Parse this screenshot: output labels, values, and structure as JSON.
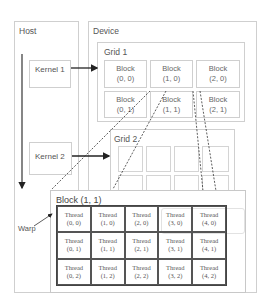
{
  "host": {
    "label": "Host"
  },
  "device": {
    "label": "Device"
  },
  "kernels": [
    {
      "label": "Kernel 1"
    },
    {
      "label": "Kernel 2"
    }
  ],
  "grid1": {
    "label": "Grid 1",
    "blocks": [
      {
        "title": "Block",
        "index": "(0, 0)"
      },
      {
        "title": "Block",
        "index": "(1, 0)"
      },
      {
        "title": "Block",
        "index": "(2, 0)"
      },
      {
        "title": "Block",
        "index": "(0, 1)"
      },
      {
        "title": "Block",
        "index": "(1, 1)"
      },
      {
        "title": "Block",
        "index": "(2, 1)"
      }
    ]
  },
  "grid2": {
    "label": "Grid 2"
  },
  "block_detail": {
    "label": "Block (1, 1)",
    "threads": [
      {
        "title": "Thread",
        "index": "(0, 0)"
      },
      {
        "title": "Thread",
        "index": "(1, 0)"
      },
      {
        "title": "Thread",
        "index": "(2, 0)"
      },
      {
        "title": "Thread",
        "index": "(3, 0)"
      },
      {
        "title": "Thread",
        "index": "(4, 0)"
      },
      {
        "title": "Thread",
        "index": "(0, 1)"
      },
      {
        "title": "Thread",
        "index": "(1, 1)"
      },
      {
        "title": "Thread",
        "index": "(2, 1)"
      },
      {
        "title": "Thread",
        "index": "(3, 1)"
      },
      {
        "title": "Thread",
        "index": "(4, 1)"
      },
      {
        "title": "Thread",
        "index": "(0, 2)"
      },
      {
        "title": "Thread",
        "index": "(1, 2)"
      },
      {
        "title": "Thread",
        "index": "(2, 2)"
      },
      {
        "title": "Thread",
        "index": "(3, 2)"
      },
      {
        "title": "Thread",
        "index": "(4, 2)"
      }
    ]
  },
  "warp": {
    "label": "Warp"
  },
  "colors": {
    "box_border": "#cfcfcf",
    "thread_border": "#444444",
    "text": "#555555"
  }
}
